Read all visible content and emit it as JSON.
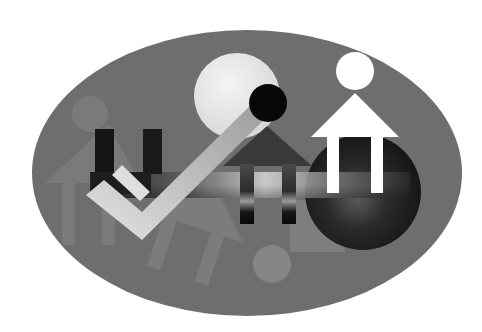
{
  "image": {
    "description": "Abstract grayscale artwork of stylized human figures (circle heads, arrow-shaped bodies) overlapping inside a gray oval",
    "colors": {
      "background": "#ffffff",
      "oval": "#6e6e6e",
      "figure_faint": "#7c7c7c",
      "figure_dark": "#111111",
      "figure_light": "#f2f2f2",
      "figure_white": "#ffffff",
      "disk_dark": "#1a1a1a"
    },
    "figures": [
      {
        "name": "faint-left-figure",
        "tone": "faint gray"
      },
      {
        "name": "dark-u-figure",
        "tone": "black"
      },
      {
        "name": "tilted-light-figure",
        "tone": "light gray, rotated"
      },
      {
        "name": "faint-tilted-figure",
        "tone": "faint gray, rotated"
      },
      {
        "name": "center-dark-figure",
        "tone": "dark gradient"
      },
      {
        "name": "white-right-figure",
        "tone": "white"
      }
    ]
  }
}
